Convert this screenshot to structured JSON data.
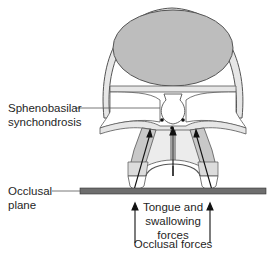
{
  "figure": {
    "labels": {
      "sphenobasilar_line1": "Sphenobasilar",
      "sphenobasilar_line2": "synchondrosis",
      "occlusal_line1": "Occlusal",
      "occlusal_line2": "plane",
      "tongue_line1": "Tongue and",
      "tongue_line2": "swallowing",
      "tongue_line3": "forces",
      "occlusal_forces": "Occlusal forces"
    },
    "caption_partial": "Fig. 11-5  Idealized growth ... (cut off)",
    "colors": {
      "cranium_fill": "#bdbdbd",
      "bone_fill": "#e6e6e6",
      "tooth_shade": "#c8c8c8",
      "outline": "#555555",
      "occlusal_bar": "#6e6e6e"
    }
  }
}
